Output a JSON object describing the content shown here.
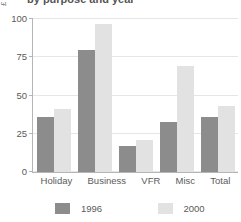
{
  "chart_data": {
    "type": "bar",
    "title": "by purpose and year",
    "xlabel": "",
    "ylabel": "£",
    "categories": [
      "Holiday",
      "Business",
      "VFR",
      "Misc",
      "Total"
    ],
    "series": [
      {
        "name": "1996",
        "color": "#8c8c8c",
        "values": [
          36,
          80,
          17,
          33,
          36
        ]
      },
      {
        "name": "2000",
        "color": "#e2e2e2",
        "values": [
          41,
          97,
          21,
          69,
          43
        ]
      }
    ],
    "ylim": [
      0,
      100
    ],
    "yticks": [
      0,
      25,
      50,
      75,
      100
    ],
    "ytick_labels": [
      "0",
      "25",
      "50",
      "75",
      "100"
    ],
    "grid": true,
    "legend_position": "bottom"
  }
}
